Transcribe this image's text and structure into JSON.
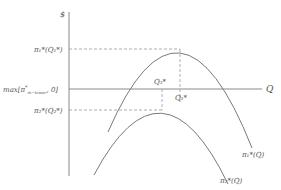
{
  "diagram": {
    "type": "profit-curves",
    "axes": {
      "y_label": "$",
      "x_label": "Q"
    },
    "y_ticks": {
      "upper": "π₁*(Q₁*)",
      "middle_prefix": "max[π",
      "middle_sup": "*",
      "middle_sub": "m−tower",
      "middle_suffix": ", 0]",
      "lower": "π₂*(Q₂*)"
    },
    "x_markers": {
      "q2": "Q₂*",
      "q1": "Q₁*"
    },
    "curves": [
      {
        "name": "upper",
        "label": "π₁*(Q)",
        "peak": {
          "x": 180,
          "y": 49
        }
      },
      {
        "name": "lower",
        "label": "π₂*(Q)",
        "peak": {
          "x": 162,
          "y": 110
        }
      }
    ],
    "colors": {
      "axis": "#8a8a8a",
      "curve": "#7a7a7a",
      "dash": "#9a9a9a",
      "text": "#555555"
    }
  }
}
